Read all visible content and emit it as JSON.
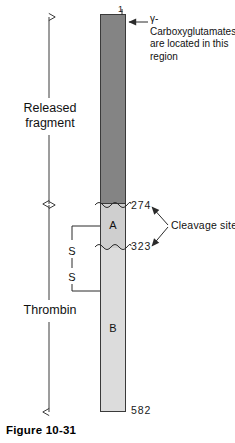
{
  "figure": {
    "caption": "Figure 10-31"
  },
  "protein_bar": {
    "segments": [
      {
        "name": "released-fragment-region",
        "label": "",
        "color": "#848484",
        "start_residue": "1",
        "end_residue": "274"
      },
      {
        "name": "segment-a",
        "label": "A",
        "color": "#cfcfcf",
        "start_residue": "274",
        "end_residue": "323"
      },
      {
        "name": "segment-b",
        "label": "B",
        "color": "#dcdcdc",
        "start_residue": "323",
        "end_residue": "582"
      }
    ],
    "residue_numbers": {
      "start": "1",
      "cleavage_upper": "274",
      "cleavage_lower": "323",
      "end": "582"
    }
  },
  "annotations": {
    "gamma_carboxyglutamates": "γ-Carboxyglutamates are located in this region",
    "cleavage_sites": "Cleavage sites",
    "disulfide_upper": "S",
    "disulfide_lower": "S"
  },
  "region_labels": {
    "released_fragment": "Released\nfragment",
    "released_fragment_line1": "Released",
    "released_fragment_line2": "fragment",
    "thrombin": "Thrombin"
  },
  "colors": {
    "dark_segment": "#848484",
    "mid_segment": "#cfcfcf",
    "light_segment": "#dcdcdc",
    "outline": "#3a3a3a",
    "text": "#111111"
  }
}
